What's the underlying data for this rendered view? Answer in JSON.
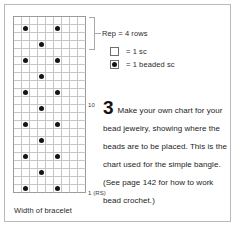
{
  "chart_data": {
    "type": "table",
    "columns": 9,
    "rows": 22,
    "xlabel": "Width of bracelet",
    "ylabel": "Rows",
    "row_number_labels": [
      {
        "row_from_bottom": 1,
        "label": "1 (RS)"
      },
      {
        "row_from_bottom": 10,
        "label": "10"
      }
    ],
    "repeat": {
      "label": "Rep = 4 rows",
      "rows": 4
    },
    "legend": [
      {
        "symbol": "empty-square",
        "label": "= 1 sc"
      },
      {
        "symbol": "dotted-square",
        "label": "= 1 beaded sc"
      }
    ],
    "bead_columns_by_row_from_top": [
      [],
      [
        1,
        5
      ],
      [],
      [
        3
      ],
      [],
      [
        1,
        5
      ],
      [],
      [
        3
      ],
      [],
      [
        1,
        5
      ],
      [],
      [
        3
      ],
      [],
      [
        1,
        5
      ],
      [],
      [
        3
      ],
      [],
      [
        1,
        5
      ],
      [],
      [
        3
      ],
      [],
      [
        1,
        5
      ]
    ]
  },
  "chart": {
    "row_labels": {
      "row_10": "10",
      "row_1": "1 (RS)"
    },
    "width_caption": "Width of bracelet"
  },
  "repeat_note": {
    "label": "Rep = 4 rows"
  },
  "legend": {
    "items": [
      {
        "label": "= 1 sc"
      },
      {
        "label": "= 1 beaded sc"
      }
    ]
  },
  "instruction": {
    "step_number": "3",
    "text": "Make your own chart for your bead jewelry, showing where the beads are to be placed. This is the chart used for the simple bangle. (See page 142 for how to work bead crochet.)"
  },
  "colors": {
    "bead": "#141414",
    "grid_line": "#c6c6c6",
    "grid_border": "#9a9a9a",
    "outer_border": "#b9b9b9",
    "text": "#1d1d1d",
    "background": "#ffffff"
  }
}
